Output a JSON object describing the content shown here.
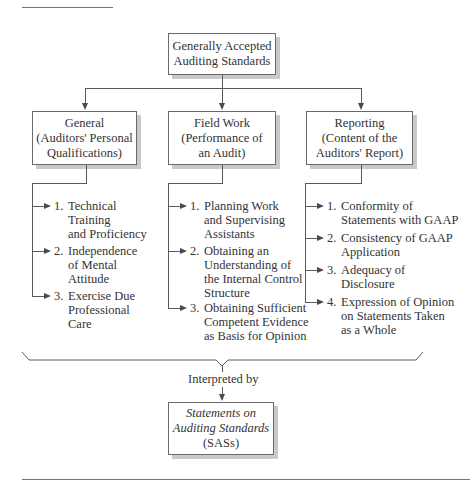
{
  "diagram": {
    "root": {
      "lines": [
        "Generally Accepted",
        "Auditing Standards"
      ]
    },
    "categories": [
      {
        "id": "general",
        "lines": [
          "General",
          "(Auditors' Personal",
          "Qualifications)"
        ],
        "items": [
          {
            "num": "1.",
            "lines": [
              "Technical",
              "Training",
              "and Proficiency"
            ]
          },
          {
            "num": "2.",
            "lines": [
              "Independence",
              "of Mental",
              "Attitude"
            ]
          },
          {
            "num": "3.",
            "lines": [
              "Exercise Due",
              "Professional",
              "Care"
            ]
          }
        ]
      },
      {
        "id": "field-work",
        "lines": [
          "Field Work",
          "(Performance of",
          "an Audit)"
        ],
        "items": [
          {
            "num": "1.",
            "lines": [
              "Planning Work",
              "and Supervising",
              "Assistants"
            ]
          },
          {
            "num": "2.",
            "lines": [
              "Obtaining an",
              "Understanding of",
              "the Internal Control",
              "Structure"
            ]
          },
          {
            "num": "3.",
            "lines": [
              "Obtaining Sufficient",
              "Competent Evidence",
              "as Basis for Opinion"
            ]
          }
        ]
      },
      {
        "id": "reporting",
        "lines": [
          "Reporting",
          "(Content of the",
          "Auditors' Report)"
        ],
        "items": [
          {
            "num": "1.",
            "lines": [
              "Conformity of",
              "Statements with GAAP"
            ]
          },
          {
            "num": "2.",
            "lines": [
              "Consistency of GAAP",
              "Application"
            ]
          },
          {
            "num": "3.",
            "lines": [
              "Adequacy of",
              "Disclosure"
            ]
          },
          {
            "num": "4.",
            "lines": [
              "Expression of Opinion",
              "on Statements Taken",
              "as a Whole"
            ]
          }
        ]
      }
    ],
    "connector_label": "Interpreted by",
    "interpretation": {
      "lines": [
        "Statements on",
        "Auditing Standards",
        "(SASs)"
      ]
    }
  }
}
